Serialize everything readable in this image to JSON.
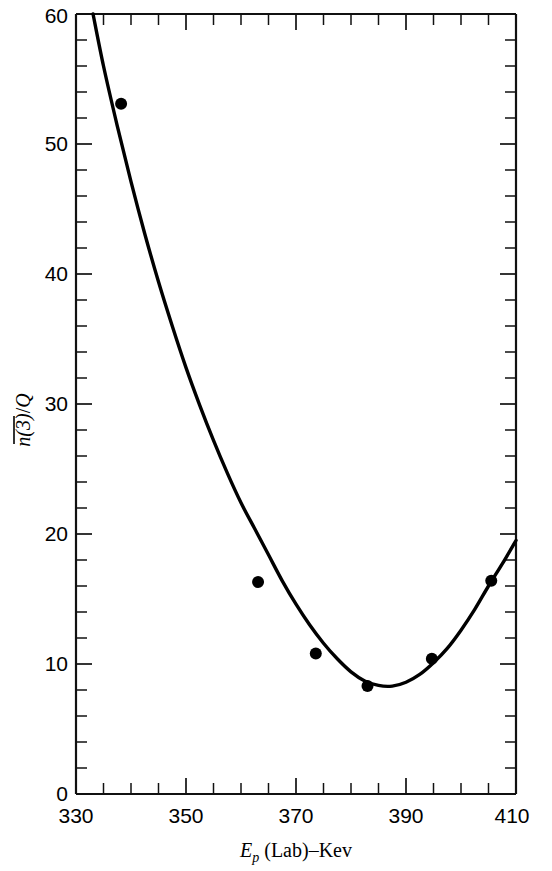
{
  "chart_data": {
    "type": "line",
    "title": "",
    "subtitle": "",
    "xlabel": "E_p (Lab)-Kev",
    "ylabel": "n(3)/Q",
    "xlim": [
      330,
      410
    ],
    "ylim": [
      0,
      60
    ],
    "grid": false,
    "legend": null,
    "x_major_tick_labels": [
      "330",
      "350",
      "370",
      "390",
      "410"
    ],
    "x_major_ticks": [
      330,
      350,
      370,
      390,
      410
    ],
    "x_minor_ticks": [
      335,
      340,
      345,
      355,
      360,
      365,
      375,
      380,
      385,
      395,
      400,
      405
    ],
    "y_major_tick_labels": [
      "0",
      "10",
      "20",
      "30",
      "40",
      "50",
      "60"
    ],
    "y_major_ticks": [
      0,
      10,
      20,
      30,
      40,
      50,
      60
    ],
    "y_minor_ticks": [
      2,
      4,
      6,
      8,
      12,
      14,
      16,
      18,
      22,
      24,
      26,
      28,
      32,
      34,
      36,
      38,
      42,
      44,
      46,
      48,
      52,
      54,
      56,
      58
    ],
    "series": [
      {
        "name": "fitted-curve",
        "style": "solid-line",
        "x": [
          333.1,
          335,
          337.5,
          340,
          342.5,
          345,
          347.5,
          350,
          352.5,
          355,
          357.5,
          360,
          362.5,
          365,
          367.5,
          370,
          372.5,
          375,
          377.5,
          380,
          382.5,
          385,
          387.5,
          390,
          392.5,
          395,
          397.5,
          400,
          402.5,
          405,
          407.5,
          410
        ],
        "y": [
          60.0,
          56.0,
          51.4,
          47.1,
          43.1,
          39.4,
          36.0,
          32.8,
          29.9,
          27.2,
          24.7,
          22.4,
          20.4,
          18.4,
          16.4,
          14.6,
          13.0,
          11.6,
          10.4,
          9.4,
          8.7,
          8.35,
          8.3,
          8.6,
          9.2,
          10.1,
          11.2,
          12.6,
          14.2,
          16.0,
          17.7,
          19.5
        ]
      },
      {
        "name": "measured-points",
        "style": "filled-circle-markers",
        "x": [
          338.2,
          363.1,
          373.6,
          383.0,
          394.7,
          405.5
        ],
        "y": [
          53.1,
          16.3,
          10.8,
          8.3,
          10.4,
          16.4
        ]
      }
    ]
  },
  "axis": {
    "y_label_parts": {
      "overbar_text": "n(3)",
      "denominator": "Q",
      "slash": "/"
    },
    "x_label_parts": {
      "symbol": "E",
      "subscript": "p",
      "rest": " (Lab)–Kev"
    }
  }
}
